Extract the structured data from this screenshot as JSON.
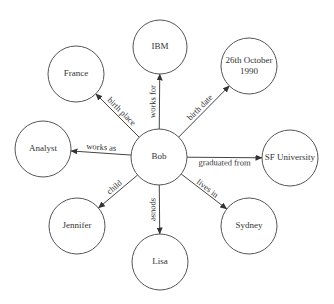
{
  "diagram": {
    "type": "knowledge-graph",
    "center": {
      "id": "bob",
      "label": "Bob",
      "x": 159,
      "y": 157,
      "r": 28
    },
    "nodes": [
      {
        "id": "ibm",
        "label": "IBM",
        "x": 160,
        "y": 47,
        "r": 27
      },
      {
        "id": "france",
        "label": "France",
        "x": 76,
        "y": 74,
        "r": 28
      },
      {
        "id": "birthdate",
        "label": "26th October",
        "label2": "1990",
        "x": 249,
        "y": 66,
        "r": 28
      },
      {
        "id": "analyst",
        "label": "Analyst",
        "x": 43,
        "y": 149,
        "r": 28
      },
      {
        "id": "sfuniversity",
        "label": "SF University",
        "x": 290,
        "y": 158,
        "r": 28
      },
      {
        "id": "jennifer",
        "label": "Jennifer",
        "x": 77,
        "y": 226,
        "r": 28
      },
      {
        "id": "sydney",
        "label": "Sydney",
        "x": 249,
        "y": 226,
        "r": 28
      },
      {
        "id": "lisa",
        "label": "Lisa",
        "x": 160,
        "y": 262,
        "r": 28
      }
    ],
    "edges": [
      {
        "from": "bob",
        "to": "ibm",
        "label": "works for"
      },
      {
        "from": "bob",
        "to": "france",
        "label": "birth place"
      },
      {
        "from": "bob",
        "to": "birthdate",
        "label": "birth date"
      },
      {
        "from": "bob",
        "to": "analyst",
        "label": "works as"
      },
      {
        "from": "bob",
        "to": "sfuniversity",
        "label": "graduated from"
      },
      {
        "from": "bob",
        "to": "jennifer",
        "label": "child"
      },
      {
        "from": "bob",
        "to": "sydney",
        "label": "lives in"
      },
      {
        "from": "bob",
        "to": "lisa",
        "label": "spouse"
      }
    ]
  },
  "colors": {
    "stroke": "#555555",
    "edge": "#444444",
    "text": "#333333",
    "background": "#ffffff"
  }
}
